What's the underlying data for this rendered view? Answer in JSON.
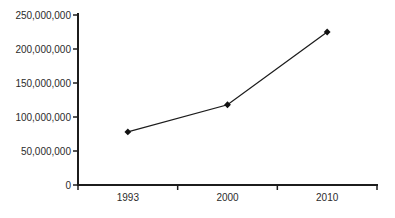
{
  "figure": {
    "background": "#ffffff"
  },
  "chart_data": {
    "type": "line",
    "title": "",
    "xlabel": "",
    "ylabel": "",
    "categories": [
      "1993",
      "2000",
      "2010"
    ],
    "values": [
      78000000,
      118000000,
      225000000
    ],
    "ylim": [
      0,
      250000000
    ],
    "yticks": [
      {
        "value": 0,
        "label": "0"
      },
      {
        "value": 50000000,
        "label": "50,000,000"
      },
      {
        "value": 100000000,
        "label": "100,000,000"
      },
      {
        "value": 150000000,
        "label": "150,000,000"
      },
      {
        "value": 200000000,
        "label": "200,000,000"
      },
      {
        "value": 250000000,
        "label": "250,000,000"
      }
    ],
    "grid": false,
    "legend": "none",
    "marker": "diamond",
    "line_color": "#1c1c1c",
    "marker_color": "#111111",
    "axis_color": "#1c1c1c",
    "tick_label_color": "#2b2b2b"
  }
}
